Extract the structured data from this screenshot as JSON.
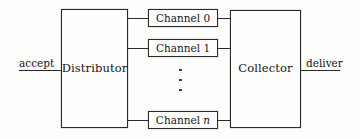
{
  "figure": {
    "type": "block-diagram",
    "background_color": "#fdfdfc",
    "line_color": "#2a2a2a",
    "text_color": "#161616"
  },
  "blocks": {
    "distributor": {
      "label": "Distributor"
    },
    "collector": {
      "label": "Collector"
    }
  },
  "channels": [
    {
      "label_prefix": "Channel",
      "index": "0",
      "index_italic": false
    },
    {
      "label_prefix": "Channel",
      "index": "1",
      "index_italic": false
    },
    {
      "label_prefix": "Channel",
      "index": "n",
      "index_italic": true
    }
  ],
  "ellipsis": {
    "glyph": "vertical-ellipsis",
    "dots": 3
  },
  "io": {
    "input": {
      "label": "accept"
    },
    "output": {
      "label": "deliver"
    }
  }
}
